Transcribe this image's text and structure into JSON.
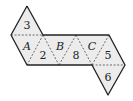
{
  "diagram": {
    "type": "octahedron-net",
    "faces": [
      {
        "id": "face-3",
        "label": "3",
        "italic": false
      },
      {
        "id": "face-A",
        "label": "A",
        "italic": true
      },
      {
        "id": "face-2",
        "label": "2",
        "italic": false
      },
      {
        "id": "face-B",
        "label": "B",
        "italic": true
      },
      {
        "id": "face-8",
        "label": "8",
        "italic": false
      },
      {
        "id": "face-C",
        "label": "C",
        "italic": true
      },
      {
        "id": "face-5",
        "label": "5",
        "italic": false
      },
      {
        "id": "face-6",
        "label": "6",
        "italic": false
      }
    ],
    "colors": {
      "fill": "#ececec",
      "edge": "#222222"
    }
  }
}
